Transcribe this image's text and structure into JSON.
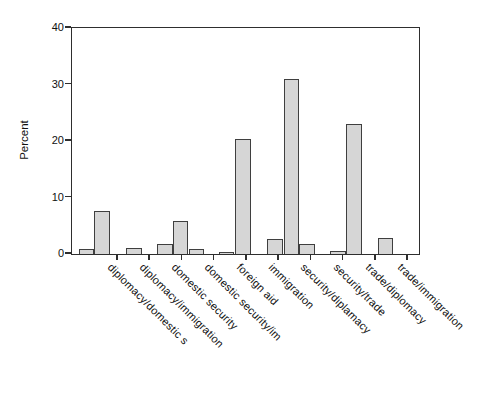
{
  "chart_data": {
    "type": "bar",
    "title": "",
    "xlabel": "",
    "ylabel": "Percent",
    "ylim": [
      0,
      40
    ],
    "yticks": [
      0,
      10,
      20,
      30,
      40
    ],
    "grid": false,
    "legend": false,
    "categories": [
      "diplomacy/domestic s",
      "diplomacy/immigration",
      "domestic security",
      "domestic security/im",
      "foreign aid",
      "immigration",
      "security/diplamacy",
      "security/trade",
      "trade/diplomacy",
      "trade/immigration"
    ],
    "category_tick_x_frac": [
      0.1326,
      0.2254,
      0.3182,
      0.4112,
      0.504,
      0.5968,
      0.6897,
      0.7827,
      0.8755,
      0.9683
    ],
    "bar_width_frac": 0.0452,
    "bars": [
      {
        "x_frac": 0.0193,
        "value": 0.8
      },
      {
        "x_frac": 0.0643,
        "value": 7.7
      },
      {
        "x_frac": 0.1556,
        "value": 1.1
      },
      {
        "x_frac": 0.245,
        "value": 1.7
      },
      {
        "x_frac": 0.2902,
        "value": 5.9
      },
      {
        "x_frac": 0.3363,
        "value": 0.8
      },
      {
        "x_frac": 0.4228,
        "value": 0.4
      },
      {
        "x_frac": 0.4706,
        "value": 20.4
      },
      {
        "x_frac": 0.562,
        "value": 2.6
      },
      {
        "x_frac": 0.6101,
        "value": 31.0
      },
      {
        "x_frac": 0.6551,
        "value": 1.8
      },
      {
        "x_frac": 0.7444,
        "value": 0.6
      },
      {
        "x_frac": 0.7896,
        "value": 23.1
      },
      {
        "x_frac": 0.881,
        "value": 2.9
      }
    ],
    "colors": {
      "bar_fill": "#d6d6d6",
      "bar_border": "#3f3f3f",
      "axis": "#2e2e2e",
      "text": "#111111",
      "background": "#ffffff"
    }
  }
}
